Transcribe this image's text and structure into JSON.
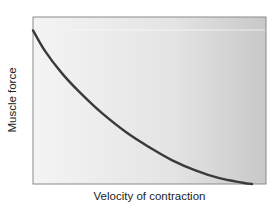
{
  "chart_data": {
    "type": "line",
    "title": "",
    "xlabel": "Velocity of contraction",
    "ylabel": "Muscle force",
    "xlim": [
      0,
      1
    ],
    "ylim": [
      0,
      1
    ],
    "grid": false,
    "legend": null,
    "ticks": false,
    "series": [
      {
        "name": "Force-velocity curve",
        "color": "#3a3a3a",
        "x": [
          0.0,
          0.05,
          0.12,
          0.2,
          0.3,
          0.4,
          0.5,
          0.6,
          0.7,
          0.8,
          0.9,
          0.94
        ],
        "y": [
          0.92,
          0.8,
          0.67,
          0.55,
          0.42,
          0.31,
          0.22,
          0.14,
          0.08,
          0.035,
          0.008,
          0.0
        ]
      }
    ],
    "plot_background": {
      "gradient_from": "#f4f4f4",
      "gradient_to": "#c8c8c8"
    }
  }
}
